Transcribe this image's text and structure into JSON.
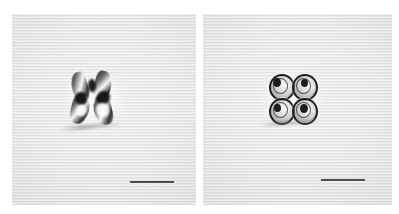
{
  "figure": {
    "background_color": "#ffffff",
    "panel_background_color": "#e4e4e4",
    "scalebar_color": "#4d4d4d",
    "specimen_dark_color": "#161616",
    "specimen_highlight_color": "#fcfcfc"
  },
  "panels": [
    {
      "id": "panel-left",
      "label": "",
      "specimen_name": "butterfly-shaped-microalga",
      "specimen_description": "single bow-tie / butterfly shaped cell with four dark lobes and bright central highlights",
      "scalebar": {
        "label": "",
        "length_px": 44
      }
    },
    {
      "id": "panel-right",
      "label": "",
      "specimen_name": "tetrad-four-celled-colony",
      "specimen_description": "four ring-shaped cells arranged in a 2x2 tetrad with dark nuclei and diffraction spikes",
      "scalebar": {
        "label": "",
        "length_px": 44
      }
    }
  ]
}
